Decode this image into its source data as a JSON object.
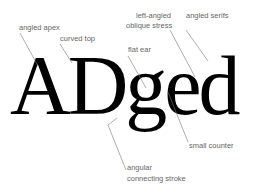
{
  "specimen": {
    "text": "ADged"
  },
  "labels": {
    "angled_apex": "angled apex",
    "curved_top": "curved top",
    "flat_ear": "flat ear",
    "oblique_stress_1": "left-angled",
    "oblique_stress_2": "oblique stress",
    "angled_serifs": "angled serifs",
    "small_counter": "small counter",
    "connecting_stroke_1": "angular",
    "connecting_stroke_2": "connecting stroke"
  },
  "colors": {
    "text": "#000000",
    "label": "#666666",
    "leader": "#777777"
  }
}
